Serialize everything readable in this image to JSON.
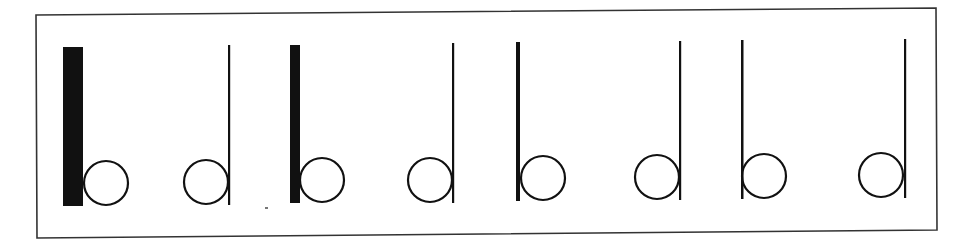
{
  "figure": {
    "frame": {
      "x1": 36,
      "y1": 15,
      "x2": 936,
      "y2": 8,
      "x3": 937,
      "y3": 230,
      "x4": 37,
      "y4": 238,
      "stroke": "#333333"
    },
    "ink_color": "#111111",
    "glyphs": [
      {
        "letter": "b",
        "stem_x": 63,
        "stem_w": 20,
        "stem_top": 47,
        "stem_bottom": 206,
        "cx": 106,
        "cy": 183,
        "r": 22
      },
      {
        "letter": "d",
        "stem_x": 228,
        "stem_w": 2.2,
        "stem_top": 45,
        "stem_bottom": 205,
        "cx": 206,
        "cy": 182,
        "r": 22
      },
      {
        "letter": "b",
        "stem_x": 290,
        "stem_w": 10,
        "stem_top": 45,
        "stem_bottom": 203,
        "cx": 322,
        "cy": 180,
        "r": 22
      },
      {
        "letter": "d",
        "stem_x": 452,
        "stem_w": 2.2,
        "stem_top": 43,
        "stem_bottom": 203,
        "cx": 430,
        "cy": 180,
        "r": 22
      },
      {
        "letter": "b",
        "stem_x": 516,
        "stem_w": 4,
        "stem_top": 42,
        "stem_bottom": 201,
        "cx": 543,
        "cy": 178,
        "r": 22
      },
      {
        "letter": "d",
        "stem_x": 679,
        "stem_w": 2.2,
        "stem_top": 41,
        "stem_bottom": 200,
        "cx": 657,
        "cy": 177,
        "r": 22
      },
      {
        "letter": "b",
        "stem_x": 741,
        "stem_w": 2.5,
        "stem_top": 40,
        "stem_bottom": 199,
        "cx": 764,
        "cy": 176,
        "r": 22
      },
      {
        "letter": "d",
        "stem_x": 904,
        "stem_w": 2.2,
        "stem_top": 39,
        "stem_bottom": 198,
        "cx": 881,
        "cy": 175,
        "r": 22
      }
    ]
  }
}
